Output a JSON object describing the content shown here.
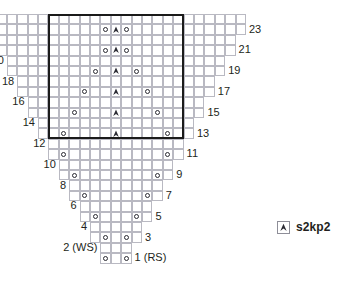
{
  "chart_data": {
    "type": "table",
    "title": "",
    "grid": {
      "total_columns": 25,
      "total_rows": 24,
      "center_column_index": 12,
      "cell_width": 10.4,
      "cell_height": 10.4,
      "origin_x": 116.0,
      "origin_y": 14.0,
      "grid_color": "#b9b9c2"
    },
    "rows": [
      {
        "number": 24,
        "side": "WS",
        "y_index": 0,
        "half_span": 12,
        "yo_offset": null,
        "decrease": false
      },
      {
        "number": 23,
        "side": "RS",
        "y_index": 1,
        "half_span": 12,
        "yo_offset": 1,
        "decrease": true
      },
      {
        "number": 22,
        "side": "WS",
        "y_index": 2,
        "half_span": 11,
        "yo_offset": null,
        "decrease": false
      },
      {
        "number": 21,
        "side": "RS",
        "y_index": 3,
        "half_span": 11,
        "yo_offset": 1,
        "decrease": true
      },
      {
        "number": 20,
        "side": "WS",
        "y_index": 4,
        "half_span": 10,
        "yo_offset": null,
        "decrease": false
      },
      {
        "number": 19,
        "side": "RS",
        "y_index": 5,
        "half_span": 10,
        "yo_offset": 2,
        "decrease": true
      },
      {
        "number": 18,
        "side": "WS",
        "y_index": 6,
        "half_span": 9,
        "yo_offset": null,
        "decrease": false
      },
      {
        "number": 17,
        "side": "RS",
        "y_index": 7,
        "half_span": 9,
        "yo_offset": 3,
        "decrease": true
      },
      {
        "number": 16,
        "side": "WS",
        "y_index": 8,
        "half_span": 8,
        "yo_offset": null,
        "decrease": false
      },
      {
        "number": 15,
        "side": "RS",
        "y_index": 9,
        "half_span": 8,
        "yo_offset": 4,
        "decrease": true
      },
      {
        "number": 14,
        "side": "WS",
        "y_index": 10,
        "half_span": 7,
        "yo_offset": null,
        "decrease": false
      },
      {
        "number": 13,
        "side": "RS",
        "y_index": 11,
        "half_span": 7,
        "yo_offset": 5,
        "decrease": true
      },
      {
        "number": 12,
        "side": "WS",
        "y_index": 12,
        "half_span": 6,
        "yo_offset": null,
        "decrease": false
      },
      {
        "number": 11,
        "side": "RS",
        "y_index": 13,
        "half_span": 6,
        "yo_offset": 5,
        "decrease": false
      },
      {
        "number": 10,
        "side": "WS",
        "y_index": 14,
        "half_span": 5,
        "yo_offset": null,
        "decrease": false
      },
      {
        "number": 9,
        "side": "RS",
        "y_index": 15,
        "half_span": 5,
        "yo_offset": 4,
        "decrease": false
      },
      {
        "number": 8,
        "side": "WS",
        "y_index": 16,
        "half_span": 4,
        "yo_offset": null,
        "decrease": false
      },
      {
        "number": 7,
        "side": "RS",
        "y_index": 17,
        "half_span": 4,
        "yo_offset": 3,
        "decrease": false
      },
      {
        "number": 6,
        "side": "WS",
        "y_index": 18,
        "half_span": 3,
        "yo_offset": null,
        "decrease": false
      },
      {
        "number": 5,
        "side": "RS",
        "y_index": 19,
        "half_span": 3,
        "yo_offset": 2,
        "decrease": false
      },
      {
        "number": 4,
        "side": "WS",
        "y_index": 20,
        "half_span": 2,
        "yo_offset": null,
        "decrease": false
      },
      {
        "number": 3,
        "side": "RS",
        "y_index": 21,
        "half_span": 2,
        "yo_offset": 1,
        "decrease": false
      },
      {
        "number": 2,
        "side": "WS",
        "y_index": 22,
        "half_span": 1,
        "yo_offset": null,
        "decrease": false
      },
      {
        "number": 1,
        "side": "RS",
        "y_index": 23,
        "half_span": 1,
        "yo_offset": 1,
        "decrease": false
      }
    ],
    "row_labels": {
      "left": [
        "24",
        "22",
        "20",
        "18",
        "16",
        "14",
        "12",
        "10",
        "8",
        "6",
        "4",
        "2 (WS)"
      ],
      "right": [
        "23",
        "21",
        "19",
        "17",
        "15",
        "13",
        "11",
        "9",
        "7",
        "5",
        "3",
        "1 (RS)"
      ]
    },
    "repeat_box": {
      "label": "pattern repeat",
      "from_row": 13,
      "to_row": 24,
      "left_column": 6,
      "right_column": 18,
      "color": "#1a1a1a"
    }
  },
  "legend": {
    "entries": [
      {
        "symbol": "centered-double-decrease",
        "label": "s2kp2"
      }
    ]
  },
  "symbols": {
    "yarn_over": {
      "name": "yarn-over",
      "glyph": "o"
    },
    "decrease": {
      "name": "s2kp2-decrease",
      "glyph": "▲"
    }
  },
  "colors": {
    "grid_line": "#b9b9c2",
    "text": "#231f20",
    "box": "#1a1a1a",
    "symbol": "#2b2b33",
    "background": "#ffffff"
  }
}
